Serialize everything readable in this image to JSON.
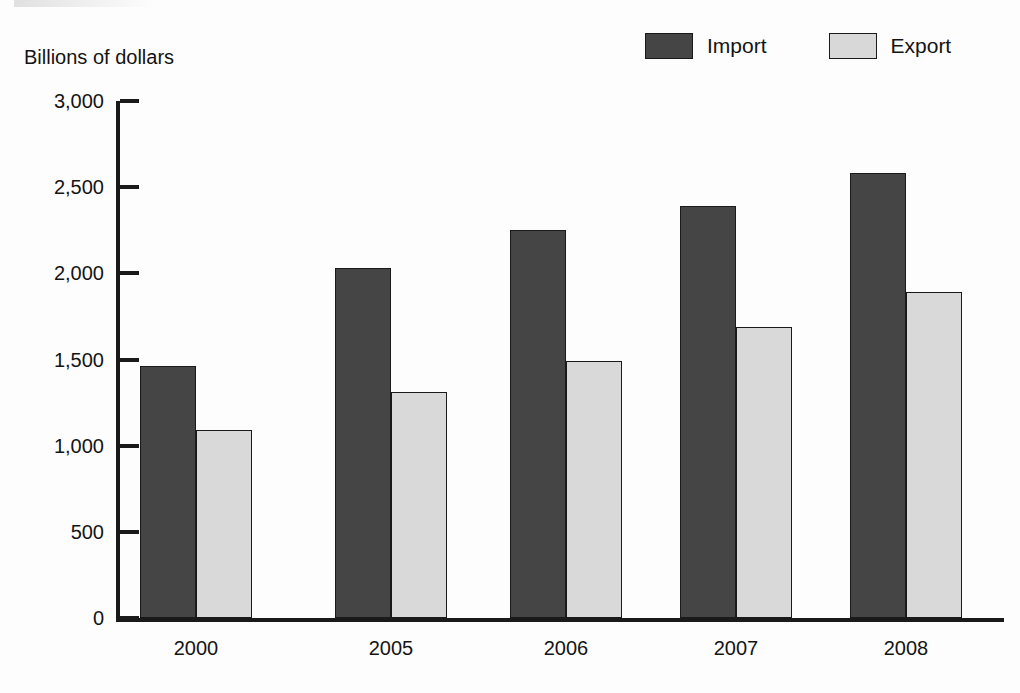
{
  "axis_title": "Billions of dollars",
  "legend": {
    "entries": [
      {
        "label": "Import",
        "color": "#454545",
        "icon": "legend-swatch-import"
      },
      {
        "label": "Export",
        "color": "#d8d8d8",
        "icon": "legend-swatch-export"
      }
    ]
  },
  "y_axis": {
    "ticks": [
      "0",
      "500",
      "1,000",
      "1,500",
      "2,000",
      "2,500",
      "3,000"
    ]
  },
  "chart_data": {
    "type": "bar",
    "title": "",
    "xlabel": "",
    "ylabel": "Billions of dollars",
    "ylim": [
      0,
      3000
    ],
    "ytick_values": [
      0,
      500,
      1000,
      1500,
      2000,
      2500,
      3000
    ],
    "ytick_labels": [
      "0",
      "500",
      "1,000",
      "1,500",
      "2,000",
      "2,500",
      "3,000"
    ],
    "grid": false,
    "legend_position": "top-right",
    "categories": [
      "2000",
      "2005",
      "2006",
      "2007",
      "2008"
    ],
    "series": [
      {
        "name": "Import",
        "color": "#454545",
        "values": [
          1460,
          2030,
          2250,
          2390,
          2580
        ]
      },
      {
        "name": "Export",
        "color": "#d9d9d9",
        "values": [
          1090,
          1310,
          1490,
          1690,
          1890
        ]
      }
    ]
  }
}
